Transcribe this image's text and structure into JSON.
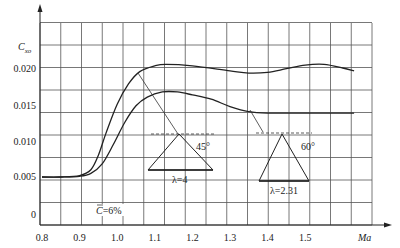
{
  "chart_data": {
    "type": "line",
    "title": "",
    "xlabel": "Ma",
    "ylabel": "C_xo",
    "xlim": [
      0.8,
      1.65
    ],
    "ylim": [
      0,
      0.022
    ],
    "grid": true,
    "x_ticks": [
      "0.8",
      "0.9",
      "1.0",
      "1.1",
      "1.2",
      "1.3",
      "1.4",
      "1.5"
    ],
    "y_ticks": [
      "0",
      "0.005",
      "0.010",
      "0.015",
      "0.020"
    ],
    "series": [
      {
        "name": "λ=4 (45°)",
        "x": [
          0.8,
          0.85,
          0.9,
          0.93,
          0.95,
          0.97,
          1.0,
          1.03,
          1.06,
          1.1,
          1.13,
          1.2,
          1.3,
          1.35,
          1.4,
          1.45,
          1.5,
          1.55,
          1.6,
          1.63
        ],
        "values": [
          0.005,
          0.005,
          0.0052,
          0.006,
          0.008,
          0.011,
          0.015,
          0.0178,
          0.0195,
          0.0203,
          0.0205,
          0.0203,
          0.0196,
          0.0193,
          0.0194,
          0.0199,
          0.0204,
          0.0205,
          0.02,
          0.0196
        ]
      },
      {
        "name": "λ=2.31 (60°)",
        "x": [
          0.8,
          0.85,
          0.9,
          0.93,
          0.96,
          0.99,
          1.02,
          1.05,
          1.08,
          1.12,
          1.16,
          1.2,
          1.25,
          1.3,
          1.35,
          1.4,
          1.5,
          1.6,
          1.63
        ],
        "values": [
          0.005,
          0.005,
          0.0051,
          0.0055,
          0.0068,
          0.0095,
          0.0125,
          0.0148,
          0.016,
          0.0167,
          0.0167,
          0.0163,
          0.0157,
          0.0147,
          0.014,
          0.0138,
          0.0138,
          0.0138,
          0.0138
        ]
      }
    ],
    "annotations": [
      {
        "text": "45°",
        "type": "angle"
      },
      {
        "text": "λ=4",
        "type": "label"
      },
      {
        "text": "60°",
        "type": "angle"
      },
      {
        "text": "λ=2.31",
        "type": "label"
      },
      {
        "text": "C̄=6%",
        "type": "label"
      }
    ]
  },
  "labels": {
    "ylabel_main": "C",
    "ylabel_sub": "xo",
    "xlabel": "Ma",
    "angle1": "45°",
    "lambda1": "λ=4",
    "angle2": "60°",
    "lambda2": "λ=2.31",
    "thickness": "=6%",
    "thickness_c": "C"
  }
}
